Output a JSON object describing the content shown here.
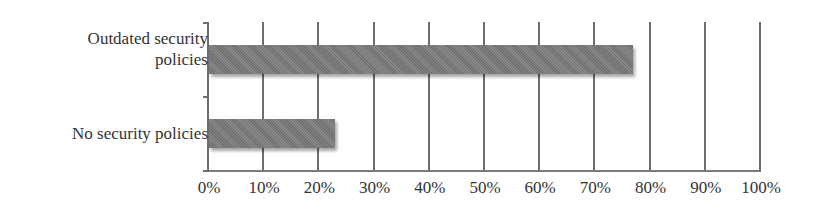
{
  "chart_data": {
    "type": "bar",
    "orientation": "horizontal",
    "title": "",
    "xlabel": "",
    "ylabel": "",
    "categories": [
      "Outdated security\npolicies",
      "No security policies"
    ],
    "values": [
      77,
      23
    ],
    "unit": "%",
    "xlim": [
      0,
      100
    ],
    "x_ticks": [
      "0%",
      "10%",
      "20%",
      "30%",
      "40%",
      "50%",
      "60%",
      "70%",
      "80%",
      "90%",
      "100%"
    ],
    "grid": "vertical",
    "legend": null,
    "bar_color": "#7d7d7d"
  }
}
